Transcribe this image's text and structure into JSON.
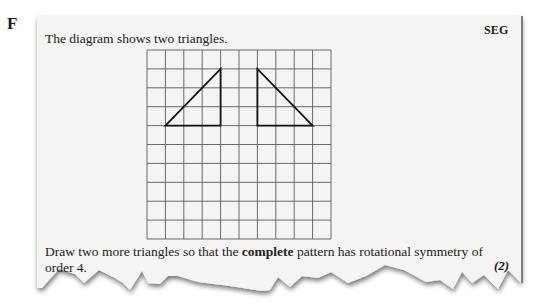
{
  "question": {
    "letter": "F",
    "board": "SEG",
    "intro": "The diagram shows two triangles.",
    "instruction_part1": "Draw two more triangles so that the ",
    "instruction_bold": "complete",
    "instruction_part2": " pattern has rotational symmetry of order 4.",
    "marks": "(2)"
  },
  "grid": {
    "columns": 10,
    "rows": 10,
    "origin_px": [
      147,
      50
    ],
    "cell_width_px": 18.4,
    "cell_height_px": 18.9
  },
  "triangles": [
    {
      "name": "left-triangle",
      "vertices_grid": [
        [
          1,
          4
        ],
        [
          4,
          1
        ],
        [
          4,
          4
        ]
      ]
    },
    {
      "name": "right-triangle",
      "vertices_grid": [
        [
          6,
          1
        ],
        [
          6,
          4
        ],
        [
          9,
          4
        ]
      ]
    }
  ],
  "colors": {
    "paper": "#f4f4f3",
    "grid_line": "#6a6a6a",
    "triangle_stroke": "#111111",
    "text": "#222222",
    "shadow": "#8a8a8a"
  }
}
